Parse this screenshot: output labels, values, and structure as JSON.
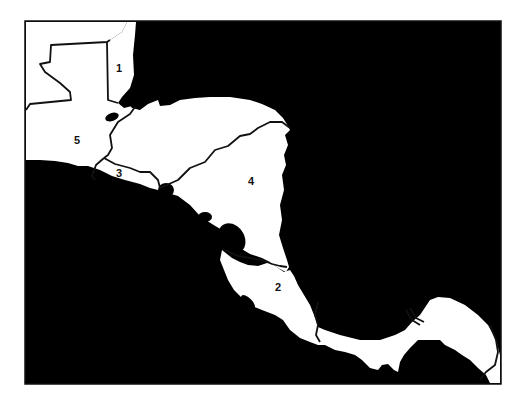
{
  "map": {
    "title": "Central America outline map",
    "colors": {
      "water": "#000000",
      "land": "#ffffff",
      "border": "#111111",
      "frame": "#111111",
      "page": "#ffffff"
    },
    "regions": [
      {
        "id": "belize",
        "label": "1",
        "x": 119,
        "y": 72
      },
      {
        "id": "costa-rica",
        "label": "2",
        "x": 278,
        "y": 291
      },
      {
        "id": "el-salvador",
        "label": "3",
        "x": 119,
        "y": 177
      },
      {
        "id": "nicaragua",
        "label": "4",
        "x": 251,
        "y": 185
      },
      {
        "id": "guatemala",
        "label": "5",
        "x": 77,
        "y": 144
      }
    ]
  }
}
